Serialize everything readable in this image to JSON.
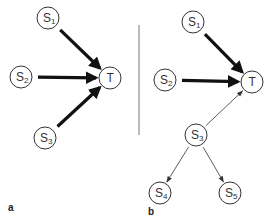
{
  "diagram": {
    "panels": [
      {
        "label": "a",
        "nodes": [
          {
            "id": "S1",
            "base": "S",
            "sub": "1",
            "x": 48,
            "y": 18
          },
          {
            "id": "S2",
            "base": "S",
            "sub": "2",
            "x": 21,
            "y": 77
          },
          {
            "id": "T",
            "base": "T",
            "sub": "",
            "x": 110,
            "y": 78
          },
          {
            "id": "S3",
            "base": "S",
            "sub": "3",
            "x": 45,
            "y": 138
          }
        ],
        "edges": [
          {
            "from": "S1",
            "to": "T",
            "weight": "thick"
          },
          {
            "from": "S2",
            "to": "T",
            "weight": "thick"
          },
          {
            "from": "S3",
            "to": "T",
            "weight": "thick"
          }
        ]
      },
      {
        "label": "b",
        "nodes": [
          {
            "id": "S1",
            "base": "S",
            "sub": "1",
            "x": 193,
            "y": 22
          },
          {
            "id": "S2",
            "base": "S",
            "sub": "2",
            "x": 165,
            "y": 80
          },
          {
            "id": "T",
            "base": "T",
            "sub": "",
            "x": 252,
            "y": 82
          },
          {
            "id": "S3",
            "base": "S",
            "sub": "3",
            "x": 196,
            "y": 135
          },
          {
            "id": "S4",
            "base": "S",
            "sub": "4",
            "x": 160,
            "y": 193
          },
          {
            "id": "S5",
            "base": "S",
            "sub": "5",
            "x": 230,
            "y": 193
          }
        ],
        "edges": [
          {
            "from": "S1",
            "to": "T",
            "weight": "thick"
          },
          {
            "from": "S2",
            "to": "T",
            "weight": "thick"
          },
          {
            "from": "S3",
            "to": "T",
            "weight": "thin"
          },
          {
            "from": "S3",
            "to": "S4",
            "weight": "thin"
          },
          {
            "from": "S3",
            "to": "S5",
            "weight": "thin"
          }
        ]
      }
    ],
    "colors": {
      "stroke": "#333333",
      "arrow": "#111111",
      "divider": "#777777"
    }
  }
}
